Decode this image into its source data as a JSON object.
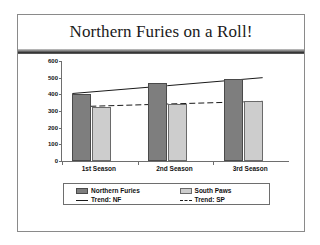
{
  "slide": {
    "title": "Northern Furies on a Roll!"
  },
  "chart_data": {
    "type": "bar",
    "title": "Northern Furies on a Roll!",
    "xlabel": "",
    "ylabel": "",
    "ylim": [
      0,
      600
    ],
    "yticks": [
      0,
      100,
      200,
      300,
      400,
      500,
      600
    ],
    "ytick_labels": [
      "0",
      "100",
      "200",
      "300",
      "400",
      "500",
      "600"
    ],
    "grid": false,
    "legend_position": "bottom",
    "categories": [
      "1st Season",
      "2nd Season",
      "3rd Season"
    ],
    "series": [
      {
        "name": "Northern Furies",
        "kind": "bar",
        "color": "#7e7e7e",
        "values": [
          405,
          468,
          495
        ]
      },
      {
        "name": "South Paws",
        "kind": "bar",
        "color": "#cdcdcd",
        "values": [
          325,
          345,
          358
        ]
      },
      {
        "name": "Trend: NF",
        "kind": "line",
        "style": "solid",
        "color": "#1a1a1a",
        "values": [
          405,
          452,
          500
        ]
      },
      {
        "name": "Trend: SP",
        "kind": "line",
        "style": "dashed",
        "color": "#1a1a1a",
        "values": [
          325,
          342,
          358
        ]
      }
    ]
  },
  "legend": {
    "entries": [
      {
        "label": "Northern Furies",
        "marker": "bar-swatch-dark"
      },
      {
        "label": "South Paws",
        "marker": "bar-swatch-light"
      },
      {
        "label": "Trend: NF",
        "marker": "solid-line"
      },
      {
        "label": "Trend: SP",
        "marker": "dashed-line"
      }
    ]
  }
}
